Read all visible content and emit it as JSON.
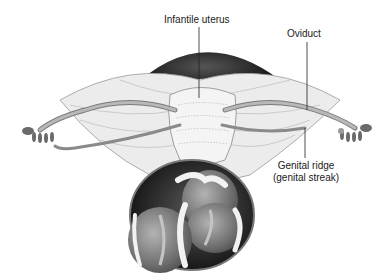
{
  "figure": {
    "labels": {
      "uterus": "Infantile uterus",
      "oviduct": "Oviduct",
      "genital_ridge_line1": "Genital ridge",
      "genital_ridge_line2": "(genital streak)"
    },
    "colors": {
      "tissue_dark": "#2a2a2a",
      "tissue_mid": "#8c8c8c",
      "tissue_light": "#d9d9d9",
      "label_text": "#1a1a1a",
      "leader_line": "#222222"
    }
  }
}
